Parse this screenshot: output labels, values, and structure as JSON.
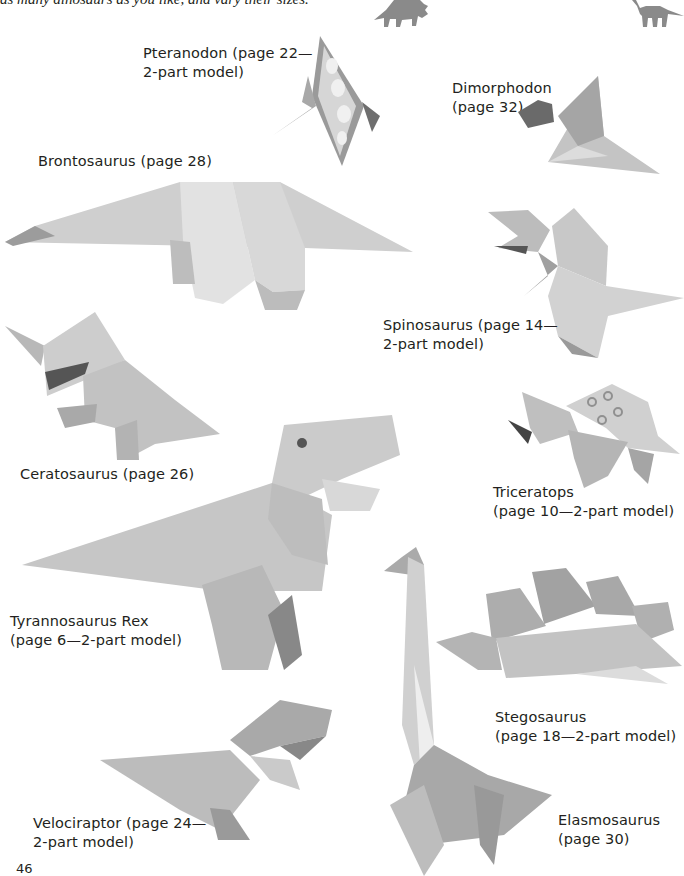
{
  "page": {
    "intro_text": "as many dinosaurs as you like, and vary their sizes.",
    "page_number": "46"
  },
  "decorations": {
    "silhouettes": [
      {
        "name": "triceratops-silhouette",
        "color": "#8a8a8a"
      },
      {
        "name": "brontosaurus-silhouette",
        "color": "#8a8a8a"
      }
    ]
  },
  "models": [
    {
      "id": "pteranodon",
      "label_lines": [
        "Pteranodon (page 22—",
        "2-part model)"
      ]
    },
    {
      "id": "dimorphodon",
      "label_lines": [
        "Dimorphodon",
        "(page 32)"
      ]
    },
    {
      "id": "brontosaurus",
      "label_lines": [
        "Brontosaurus (page 28)"
      ]
    },
    {
      "id": "spinosaurus",
      "label_lines": [
        "Spinosaurus (page 14—",
        "2-part model)"
      ]
    },
    {
      "id": "ceratosaurus",
      "label_lines": [
        "Ceratosaurus (page 26)"
      ]
    },
    {
      "id": "triceratops",
      "label_lines": [
        "Triceratops",
        "(page 10—2-part model)"
      ]
    },
    {
      "id": "tyrannosaurus-rex",
      "label_lines": [
        "Tyrannosaurus Rex",
        "(page 6—2-part model)"
      ]
    },
    {
      "id": "stegosaurus",
      "label_lines": [
        "Stegosaurus",
        "(page 18—2-part model)"
      ]
    },
    {
      "id": "velociraptor",
      "label_lines": [
        "Velociraptor (page 24—",
        "2-part model)"
      ]
    },
    {
      "id": "elasmosaurus",
      "label_lines": [
        "Elasmosaurus",
        "(page 30)"
      ]
    }
  ]
}
